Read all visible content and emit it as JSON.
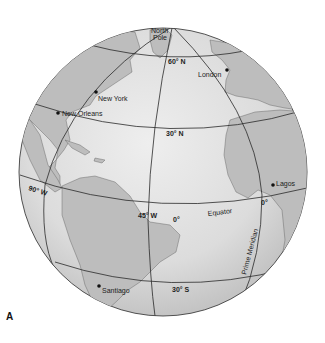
{
  "figure": {
    "label": "A",
    "colors": {
      "ocean": "#e2e2e2",
      "ocean_shade": "#c8c8c8",
      "land": "#bdbdbd",
      "line": "#2a2a2a",
      "background": "#ffffff"
    }
  },
  "parallels": [
    {
      "id": "lat-60n",
      "label": "60° N"
    },
    {
      "id": "lat-30n",
      "label": "30° N"
    },
    {
      "id": "equator",
      "label": "0°",
      "name": "Equator"
    },
    {
      "id": "lat-30s",
      "label": "30° S"
    }
  ],
  "meridians": [
    {
      "id": "lon-90w",
      "label": "90° W"
    },
    {
      "id": "lon-45w",
      "label": "45° W"
    },
    {
      "id": "lon-0",
      "label": "0°",
      "name": "Prime Meridian"
    }
  ],
  "pole": {
    "label_line1": "North",
    "label_line2": "Pole"
  },
  "cities": [
    {
      "name": "New York"
    },
    {
      "name": "New Orleans"
    },
    {
      "name": "London"
    },
    {
      "name": "Lagos"
    },
    {
      "name": "Santiago"
    }
  ]
}
